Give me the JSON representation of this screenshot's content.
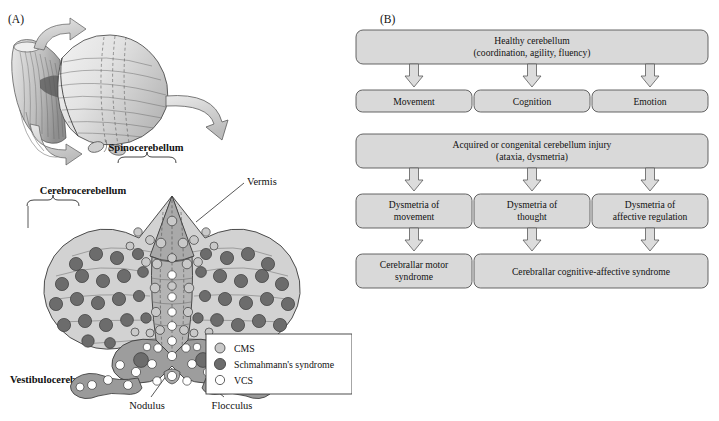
{
  "figure": {
    "panel_a_label": "(A)",
    "panel_b_label": "(B)",
    "background_color": "#ffffff"
  },
  "colors": {
    "box_fill": "#d9d9d9",
    "box_stroke": "#555555",
    "arrow_fill": "#dcdcdc",
    "arrow_stroke": "#5a5a5a",
    "wing_fill": "#d2d2d2",
    "vermis_fill": "#b4b4b4",
    "spinocerebellum_fill": "#a9a9a9",
    "flocculonodular_fill": "#9d9d9d",
    "cms_dot": "#c9c9c9",
    "schmahmann_dot": "#6c6c6c",
    "vcs_dot": "#ffffff",
    "outline": "#3b3b3b"
  },
  "panel_a": {
    "labels": {
      "spinocerebellum": "Spinocerebellum",
      "cerebrocerebellum": "Cerebrocerebellum",
      "vestibulocerebellum": "Vestibulocerebellum",
      "vermis": "Vermis",
      "nodulus": "Nodulus",
      "flocculus": "Flocculus"
    },
    "legend": {
      "items": [
        {
          "label": "CMS",
          "marker": "light-gray-circle",
          "color": "#c9c9c9"
        },
        {
          "label": "Schmahmann's syndrome",
          "marker": "dark-gray-circle",
          "color": "#6c6c6c"
        },
        {
          "label": "VCS",
          "marker": "white-circle",
          "color": "#ffffff"
        }
      ]
    }
  },
  "panel_b": {
    "rows": [
      {
        "id": "healthy",
        "boxes": [
          {
            "id": "healthy-cerebellum",
            "lines": [
              "Healthy cerebellum",
              "(coordination, agility, fluency)"
            ],
            "span": "full"
          }
        ]
      },
      {
        "id": "functions",
        "boxes": [
          {
            "id": "movement",
            "lines": [
              "Movement"
            ],
            "span": "col1"
          },
          {
            "id": "cognition",
            "lines": [
              "Cognition"
            ],
            "span": "col2"
          },
          {
            "id": "emotion",
            "lines": [
              "Emotion"
            ],
            "span": "col3"
          }
        ]
      },
      {
        "id": "injury",
        "boxes": [
          {
            "id": "cerebellum-injury",
            "lines": [
              "Acquired or congenital cerebellum injury",
              "(ataxia, dysmetria)"
            ],
            "span": "full"
          }
        ]
      },
      {
        "id": "dysmetria",
        "boxes": [
          {
            "id": "dysmetria-of-movement",
            "lines": [
              "Dysmetria of",
              "movement"
            ],
            "span": "col1"
          },
          {
            "id": "dysmetria-of-thought",
            "lines": [
              "Dysmetria of",
              "thought"
            ],
            "span": "col2"
          },
          {
            "id": "dysmetria-of-affective-regulation",
            "lines": [
              "Dysmetria of",
              "affective regulation"
            ],
            "span": "col3"
          }
        ]
      },
      {
        "id": "syndromes",
        "boxes": [
          {
            "id": "cerebellar-motor-syndrome",
            "lines": [
              "Cerebrallar motor",
              "syndrome"
            ],
            "span": "col1"
          },
          {
            "id": "cerebellar-cognitive-affective-syndrome",
            "lines": [
              "Cerebrallar cognitive-affective syndrome"
            ],
            "span": "col2-3"
          }
        ]
      }
    ]
  }
}
